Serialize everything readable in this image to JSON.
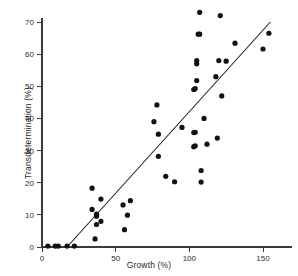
{
  "chart_data": {
    "type": "scatter",
    "title": "",
    "xlabel": "Growth (%)",
    "ylabel": "Transdetermination (%)",
    "xlim": [
      0,
      160
    ],
    "ylim": [
      0,
      75
    ],
    "xticks": [
      0,
      50,
      100,
      150
    ],
    "yticks": [
      0,
      10,
      20,
      30,
      40,
      50,
      60,
      70
    ],
    "grid": false,
    "legend": null,
    "marker": "filled-circle",
    "marker_color": "#111111",
    "axis_color": "#3a3a3a",
    "points": [
      {
        "x": 4,
        "y": 0.3
      },
      {
        "x": 9,
        "y": 0.3
      },
      {
        "x": 11,
        "y": 0.3
      },
      {
        "x": 17,
        "y": 0.3
      },
      {
        "x": 22,
        "y": 0.3
      },
      {
        "x": 34,
        "y": 18.3
      },
      {
        "x": 34,
        "y": 11.7
      },
      {
        "x": 36,
        "y": 2.5
      },
      {
        "x": 37,
        "y": 10.2
      },
      {
        "x": 37,
        "y": 9.6
      },
      {
        "x": 37,
        "y": 7.0
      },
      {
        "x": 40,
        "y": 14.9
      },
      {
        "x": 40,
        "y": 8.0
      },
      {
        "x": 55,
        "y": 13.1
      },
      {
        "x": 56,
        "y": 5.4
      },
      {
        "x": 58,
        "y": 9.9
      },
      {
        "x": 60,
        "y": 14.4
      },
      {
        "x": 76,
        "y": 39.0
      },
      {
        "x": 78,
        "y": 44.2
      },
      {
        "x": 79,
        "y": 35.1
      },
      {
        "x": 79,
        "y": 28.2
      },
      {
        "x": 84,
        "y": 22.0
      },
      {
        "x": 90,
        "y": 20.3
      },
      {
        "x": 95,
        "y": 37.2
      },
      {
        "x": 103,
        "y": 49.0
      },
      {
        "x": 103,
        "y": 35.6
      },
      {
        "x": 103,
        "y": 31.2
      },
      {
        "x": 104,
        "y": 49.3
      },
      {
        "x": 104,
        "y": 35.7
      },
      {
        "x": 104,
        "y": 31.5
      },
      {
        "x": 105,
        "y": 57.0
      },
      {
        "x": 105,
        "y": 58.0
      },
      {
        "x": 105,
        "y": 51.8
      },
      {
        "x": 106,
        "y": 66.2
      },
      {
        "x": 107,
        "y": 66.2
      },
      {
        "x": 107,
        "y": 73.0
      },
      {
        "x": 108,
        "y": 23.8
      },
      {
        "x": 108,
        "y": 20.2
      },
      {
        "x": 110,
        "y": 40.0
      },
      {
        "x": 112,
        "y": 32.0
      },
      {
        "x": 118,
        "y": 53.0
      },
      {
        "x": 119,
        "y": 33.9
      },
      {
        "x": 120,
        "y": 58.0
      },
      {
        "x": 121,
        "y": 72.0
      },
      {
        "x": 122,
        "y": 47.0
      },
      {
        "x": 125,
        "y": 57.8
      },
      {
        "x": 131,
        "y": 63.4
      },
      {
        "x": 150,
        "y": 61.6
      },
      {
        "x": 154,
        "y": 66.5
      }
    ],
    "fit_line": {
      "name": "regression line",
      "x_start": 17,
      "y_start": 0,
      "x_end": 155,
      "y_end": 70
    }
  }
}
